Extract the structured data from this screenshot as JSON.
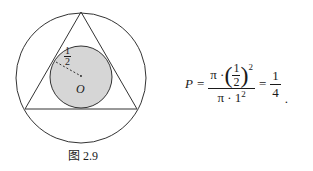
{
  "figure": {
    "caption": "图 2.9",
    "radius_label_num": "1",
    "radius_label_den": "2",
    "center_label": "O",
    "colors": {
      "stroke": "#333333",
      "fill": "#d6d6d6"
    }
  },
  "formula": {
    "lhs": "P",
    "eq1": "=",
    "num_pi": "π ·",
    "num_frac_n": "1",
    "num_frac_d": "2",
    "num_exp": "2",
    "den_text": "π · 1",
    "den_exp": "2",
    "eq2": "=",
    "result_n": "1",
    "result_d": "4",
    "end": "."
  }
}
